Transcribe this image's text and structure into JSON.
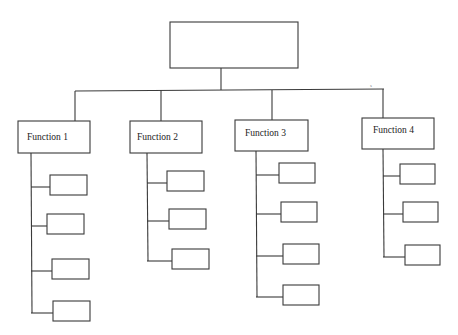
{
  "diagram": {
    "type": "org-chart",
    "root": {
      "label": ""
    },
    "functions": [
      {
        "label": "Function 1",
        "children": [
          "",
          "",
          "",
          ""
        ]
      },
      {
        "label": "Function 2",
        "children": [
          "",
          "",
          ""
        ]
      },
      {
        "label": "Function 3",
        "children": [
          "",
          "",
          "",
          ""
        ]
      },
      {
        "label": "Function 4",
        "children": [
          "",
          "",
          ""
        ]
      }
    ],
    "stray_mark": "s"
  }
}
